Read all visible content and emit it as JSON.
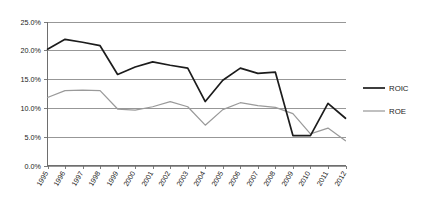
{
  "chart_data": {
    "type": "line",
    "title": "",
    "subtitle": "",
    "xlabel": "",
    "ylabel": "",
    "x": [
      1995,
      1996,
      1997,
      1998,
      1999,
      2000,
      2001,
      2002,
      2003,
      2004,
      2005,
      2006,
      2007,
      2008,
      2009,
      2010,
      2011,
      2012
    ],
    "categories": [
      "1995",
      "1996",
      "1997",
      "1998",
      "1999",
      "2000",
      "2001",
      "2002",
      "2003",
      "2004",
      "2005",
      "2006",
      "2007",
      "2008",
      "2009",
      "2010",
      "2011",
      "2012"
    ],
    "series": [
      {
        "name": "ROIC",
        "color": "#1c1c1c",
        "values": [
          20.2,
          21.9,
          21.4,
          20.8,
          15.8,
          17.1,
          18.0,
          17.4,
          16.9,
          11.1,
          14.8,
          16.9,
          16.0,
          16.2,
          5.2,
          5.2,
          10.8,
          8.2
        ]
      },
      {
        "name": "ROE",
        "color": "#9a9a9a",
        "values": [
          11.8,
          13.0,
          13.1,
          13.0,
          9.8,
          9.6,
          10.2,
          11.1,
          10.2,
          7.0,
          9.7,
          10.9,
          10.4,
          10.1,
          9.0,
          5.5,
          6.5,
          4.3
        ]
      }
    ],
    "ylim": [
      0,
      25
    ],
    "yticks": [
      0,
      5,
      10,
      15,
      20,
      25
    ],
    "ytick_labels": [
      "0.0%",
      "5.0%",
      "10.0%",
      "15.0%",
      "20.0%",
      "25.0%"
    ],
    "grid": true,
    "grid_axis": "y",
    "legend_position": "right",
    "legend": [
      "ROIC",
      "ROE"
    ]
  },
  "axes": {
    "y": {
      "labels": [
        "25.0%",
        "20.0%",
        "15.0%",
        "10.0%",
        "5.0%",
        "0.0%"
      ]
    },
    "x": {
      "labels": [
        "1995",
        "1996",
        "1997",
        "1998",
        "1999",
        "2000",
        "2001",
        "2002",
        "2003",
        "2004",
        "2005",
        "2006",
        "2007",
        "2008",
        "2009",
        "2010",
        "2011",
        "2012"
      ]
    }
  },
  "legend": {
    "items": [
      {
        "label": "ROIC",
        "color": "#1c1c1c"
      },
      {
        "label": "ROE",
        "color": "#9a9a9a"
      }
    ]
  },
  "colors": {
    "roic": "#1c1c1c",
    "roe": "#9a9a9a",
    "grid": "#8c8c8c",
    "axis": "#6e6e6e",
    "text": "#1a1a1a",
    "background": "#ffffff"
  }
}
